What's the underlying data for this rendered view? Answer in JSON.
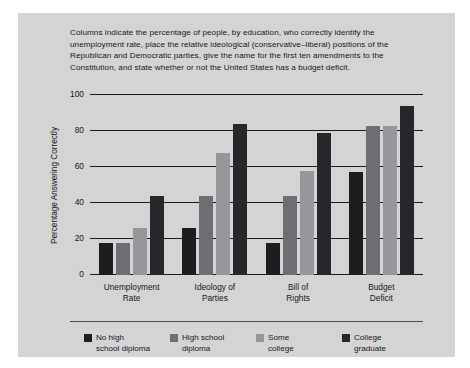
{
  "caption": "Columns indicate the percentage of people, by education, who correctly identify the unemployment rate, place the relative ideological (conservative–liberal) positions of the Republican and Democratic parties, give the name for the first ten amendments to the Constitution, and state whether or not the United States has a budget deficit.",
  "chart_data": {
    "type": "bar",
    "title": "",
    "xlabel": "",
    "ylabel": "Percentage Answering Correctly",
    "ylim": [
      0,
      100
    ],
    "yticks": [
      0,
      20,
      40,
      60,
      80,
      100
    ],
    "ytick_labels": [
      "0",
      "20",
      "40",
      "60",
      "80",
      "100"
    ],
    "grid": true,
    "legend_position": "bottom",
    "categories": [
      "Unemployment Rate",
      "Ideology of Parties",
      "Bill of Rights",
      "Budget Deficit"
    ],
    "category_lines": [
      [
        "Unemployment",
        "Rate"
      ],
      [
        "Ideology of",
        "Parties"
      ],
      [
        "Bill of",
        "Rights"
      ],
      [
        "Budget",
        "Deficit"
      ]
    ],
    "series": [
      {
        "name": "No high school diploma",
        "name_lines": [
          "No high",
          "school diploma"
        ],
        "color": "#1d1d20",
        "values": [
          18,
          26,
          18,
          57
        ]
      },
      {
        "name": "High school diploma",
        "name_lines": [
          "High school",
          "diploma"
        ],
        "color": "#6d6d72",
        "values": [
          18,
          44,
          44,
          83
        ]
      },
      {
        "name": "Some college",
        "name_lines": [
          "Some",
          "college"
        ],
        "color": "#96969b",
        "values": [
          26,
          68,
          58,
          83
        ]
      },
      {
        "name": "College graduate",
        "name_lines": [
          "College",
          "graduate"
        ],
        "color": "#27272b",
        "values": [
          44,
          84,
          79,
          94
        ]
      }
    ]
  },
  "colors": {
    "panel_background": "#d4d4d4",
    "page_background": "#ffffff",
    "axis": "#1b1b1e",
    "text": "#17171a"
  }
}
